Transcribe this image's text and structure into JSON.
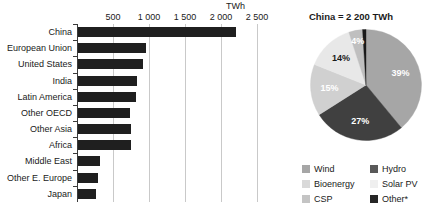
{
  "chart_data": [
    {
      "type": "bar",
      "orientation": "horizontal",
      "title": "",
      "xlabel": "TWh",
      "ylabel": "",
      "unit_label": "TWh",
      "xlim": [
        0,
        2500
      ],
      "ticks": [
        "500",
        "1 000",
        "1 500",
        "2 000",
        "2 500"
      ],
      "tick_values": [
        500,
        1000,
        1500,
        2000,
        2500
      ],
      "grid": true,
      "legend": "none",
      "bar_color": "#1f1f1f",
      "categories": [
        "China",
        "European Union",
        "United States",
        "India",
        "Latin America",
        "Other OECD",
        "Other Asia",
        "Africa",
        "Middle East",
        "Other E. Europe",
        "Japan"
      ],
      "values": [
        2200,
        950,
        900,
        820,
        800,
        720,
        740,
        730,
        300,
        280,
        250
      ]
    },
    {
      "type": "pie",
      "title": "China = 2 200 TWh",
      "legend_position": "bottom",
      "labels": [
        "Hydro",
        "Wind",
        "Solar PV",
        "Bioenergy",
        "CSP",
        "Other*"
      ],
      "values": [
        39,
        27,
        15,
        14,
        4,
        1
      ],
      "display_labels": [
        "39%",
        "27%",
        "15%",
        "14%",
        "4%",
        ""
      ],
      "colors": [
        "#a6a6a6",
        "#404040",
        "#d0d0d0",
        "#e8e8e8",
        "#bfbfbf",
        "#1a1a1a"
      ],
      "label_colors": [
        "#ffffff",
        "#ffffff",
        "#ffffff",
        "#1a1a1a",
        "#ffffff",
        "#ffffff"
      ]
    }
  ],
  "bar_chart": {
    "unit_label": "TWh",
    "ticks": [
      {
        "label": "500",
        "value": 500
      },
      {
        "label": "1 000",
        "value": 1000
      },
      {
        "label": "1 500",
        "value": 1500
      },
      {
        "label": "2 000",
        "value": 2000
      },
      {
        "label": "2 500",
        "value": 2500
      }
    ],
    "rows": [
      {
        "label": "China",
        "value": 2200
      },
      {
        "label": "European Union",
        "value": 950
      },
      {
        "label": "United States",
        "value": 900
      },
      {
        "label": "India",
        "value": 820
      },
      {
        "label": "Latin America",
        "value": 800
      },
      {
        "label": "Other OECD",
        "value": 720
      },
      {
        "label": "Other Asia",
        "value": 740
      },
      {
        "label": "Africa",
        "value": 730
      },
      {
        "label": "Middle East",
        "value": 300
      },
      {
        "label": "Other E. Europe",
        "value": 280
      },
      {
        "label": "Japan",
        "value": 250
      }
    ]
  },
  "pie_chart": {
    "title": "China = 2 200 TWh",
    "slices": [
      {
        "name": "Hydro",
        "value": 39,
        "display": "39%",
        "color": "#a6a6a6",
        "text_color": "#ffffff"
      },
      {
        "name": "Wind",
        "value": 27,
        "display": "27%",
        "color": "#404040",
        "text_color": "#ffffff"
      },
      {
        "name": "Solar PV",
        "value": 15,
        "display": "15%",
        "color": "#d0d0d0",
        "text_color": "#ffffff"
      },
      {
        "name": "Bioenergy",
        "value": 14,
        "display": "14%",
        "color": "#e8e8e8",
        "text_color": "#1a1a1a"
      },
      {
        "name": "CSP",
        "value": 4,
        "display": "4%",
        "color": "#bfbfbf",
        "text_color": "#ffffff"
      },
      {
        "name": "Other*",
        "value": 1,
        "display": "",
        "color": "#1a1a1a",
        "text_color": "#ffffff"
      }
    ],
    "legend": [
      {
        "label": "Wind",
        "color": "#a6a6a6"
      },
      {
        "label": "Hydro",
        "color": "#595959"
      },
      {
        "label": "Bioenergy",
        "color": "#d9d9d9"
      },
      {
        "label": "Solar PV",
        "color": "#efefef"
      },
      {
        "label": "CSP",
        "color": "#c4c4c4"
      },
      {
        "label": "Other*",
        "color": "#262626"
      }
    ]
  }
}
